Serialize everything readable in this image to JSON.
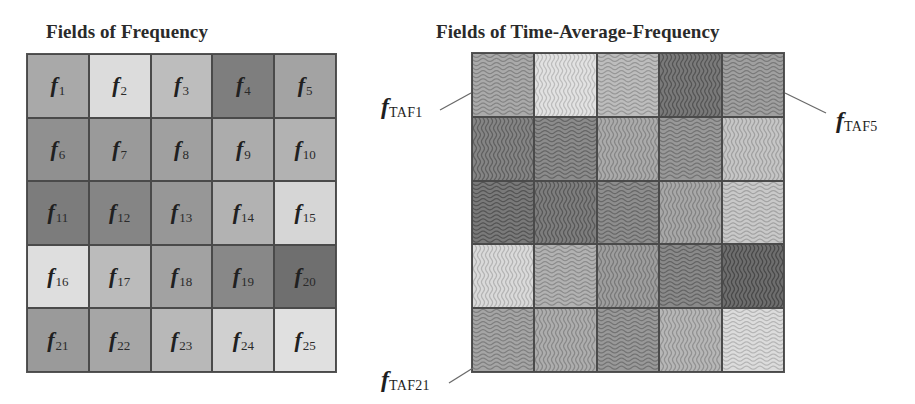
{
  "left_panel": {
    "title": "Fields of Frequency",
    "cells": [
      {
        "label": "f",
        "index": "1",
        "shade": "#a9a9a9"
      },
      {
        "label": "f",
        "index": "2",
        "shade": "#dcdcdc"
      },
      {
        "label": "f",
        "index": "3",
        "shade": "#bdbdbd"
      },
      {
        "label": "f",
        "index": "4",
        "shade": "#7e7e7e"
      },
      {
        "label": "f",
        "index": "5",
        "shade": "#a3a3a3"
      },
      {
        "label": "f",
        "index": "6",
        "shade": "#909090"
      },
      {
        "label": "f",
        "index": "7",
        "shade": "#9a9a9a"
      },
      {
        "label": "f",
        "index": "8",
        "shade": "#a0a0a0"
      },
      {
        "label": "f",
        "index": "9",
        "shade": "#acacac"
      },
      {
        "label": "f",
        "index": "10",
        "shade": "#b2b2b2"
      },
      {
        "label": "f",
        "index": "11",
        "shade": "#7c7c7c"
      },
      {
        "label": "f",
        "index": "12",
        "shade": "#858585"
      },
      {
        "label": "f",
        "index": "13",
        "shade": "#979797"
      },
      {
        "label": "f",
        "index": "14",
        "shade": "#b2b2b2"
      },
      {
        "label": "f",
        "index": "15",
        "shade": "#d6d6d6"
      },
      {
        "label": "f",
        "index": "16",
        "shade": "#dedede"
      },
      {
        "label": "f",
        "index": "17",
        "shade": "#bbbbbb"
      },
      {
        "label": "f",
        "index": "18",
        "shade": "#a2a2a2"
      },
      {
        "label": "f",
        "index": "19",
        "shade": "#888888"
      },
      {
        "label": "f",
        "index": "20",
        "shade": "#6f6f6f"
      },
      {
        "label": "f",
        "index": "21",
        "shade": "#9a9a9a"
      },
      {
        "label": "f",
        "index": "22",
        "shade": "#a6a6a6"
      },
      {
        "label": "f",
        "index": "23",
        "shade": "#b8b8b8"
      },
      {
        "label": "f",
        "index": "24",
        "shade": "#d0d0d0"
      },
      {
        "label": "f",
        "index": "25",
        "shade": "#e0e0e0"
      }
    ]
  },
  "right_panel": {
    "title": "Fields of Time-Average-Frequency",
    "cells": [
      {
        "shade": "#aaaaaa",
        "wave": "horizontal"
      },
      {
        "shade": "#e2e2e2",
        "wave": "vertical"
      },
      {
        "shade": "#bdbdbd",
        "wave": "horizontal"
      },
      {
        "shade": "#7a7a7a",
        "wave": "vertical"
      },
      {
        "shade": "#a0a0a0",
        "wave": "horizontal"
      },
      {
        "shade": "#858585",
        "wave": "vertical"
      },
      {
        "shade": "#8c8c8c",
        "wave": "horizontal"
      },
      {
        "shade": "#ababab",
        "wave": "vertical"
      },
      {
        "shade": "#999999",
        "wave": "horizontal"
      },
      {
        "shade": "#c6c6c6",
        "wave": "vertical"
      },
      {
        "shade": "#7a7a7a",
        "wave": "horizontal"
      },
      {
        "shade": "#7e7e7e",
        "wave": "vertical"
      },
      {
        "shade": "#8e8e8e",
        "wave": "horizontal"
      },
      {
        "shade": "#a8a8a8",
        "wave": "vertical"
      },
      {
        "shade": "#c9c9c9",
        "wave": "horizontal"
      },
      {
        "shade": "#dadada",
        "wave": "vertical"
      },
      {
        "shade": "#b2b2b2",
        "wave": "horizontal"
      },
      {
        "shade": "#9e9e9e",
        "wave": "vertical"
      },
      {
        "shade": "#8a8a8a",
        "wave": "horizontal"
      },
      {
        "shade": "#6e6e6e",
        "wave": "vertical"
      },
      {
        "shade": "#a5a5a5",
        "wave": "horizontal"
      },
      {
        "shade": "#aeaeae",
        "wave": "vertical"
      },
      {
        "shade": "#999999",
        "wave": "horizontal"
      },
      {
        "shade": "#b7b7b7",
        "wave": "vertical"
      },
      {
        "shade": "#dcdcdc",
        "wave": "horizontal"
      }
    ],
    "callouts": [
      {
        "id": "taf1",
        "symbol": "f",
        "subscript": "TAF1"
      },
      {
        "id": "taf5",
        "symbol": "f",
        "subscript": "TAF5"
      },
      {
        "id": "taf21",
        "symbol": "f",
        "subscript": "TAF21"
      }
    ]
  },
  "colors": {
    "grid_border": "#4a4a4a",
    "text": "#1e1e1e",
    "leader_line": "#6a6a6a"
  }
}
